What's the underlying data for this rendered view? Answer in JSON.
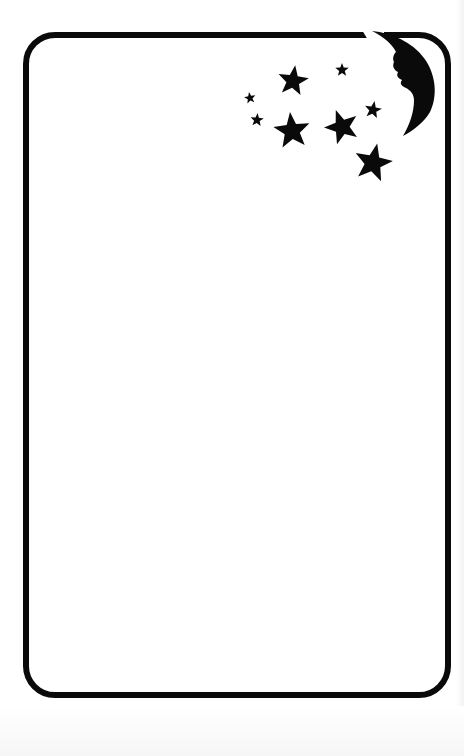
{
  "card": {
    "type": "blank decorative card frame",
    "border_color": "#0a0a0a",
    "background": "#ffffff"
  },
  "decorations": {
    "moon": {
      "name": "crescent-moon-with-face",
      "color": "#0a0a0a"
    },
    "stars": [
      {
        "cx": 293,
        "cy": 81,
        "r": 16,
        "rot": 8
      },
      {
        "cx": 342,
        "cy": 70,
        "r": 7,
        "rot": 0
      },
      {
        "cx": 250,
        "cy": 98,
        "r": 6,
        "rot": -10
      },
      {
        "cx": 257,
        "cy": 120,
        "r": 7,
        "rot": 5
      },
      {
        "cx": 292,
        "cy": 131,
        "r": 19,
        "rot": -6
      },
      {
        "cx": 342,
        "cy": 127,
        "r": 18,
        "rot": -20
      },
      {
        "cx": 373,
        "cy": 110,
        "r": 9,
        "rot": 10
      },
      {
        "cx": 373,
        "cy": 163,
        "r": 20,
        "rot": 12
      }
    ],
    "star_color": "#0a0a0a"
  }
}
